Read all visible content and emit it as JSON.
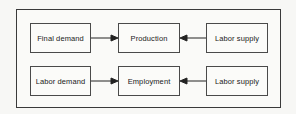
{
  "diagram": {
    "rows": [
      {
        "left": "Final demand",
        "center": "Production",
        "right": "Labor supply"
      },
      {
        "left": "Labor demand",
        "center": "Employment",
        "right": "Labor supply"
      }
    ],
    "edges": [
      {
        "from": "Final demand",
        "to": "Production"
      },
      {
        "from": "Labor supply",
        "to": "Production"
      },
      {
        "from": "Labor demand",
        "to": "Employment"
      },
      {
        "from": "Labor supply",
        "to": "Employment"
      }
    ]
  }
}
